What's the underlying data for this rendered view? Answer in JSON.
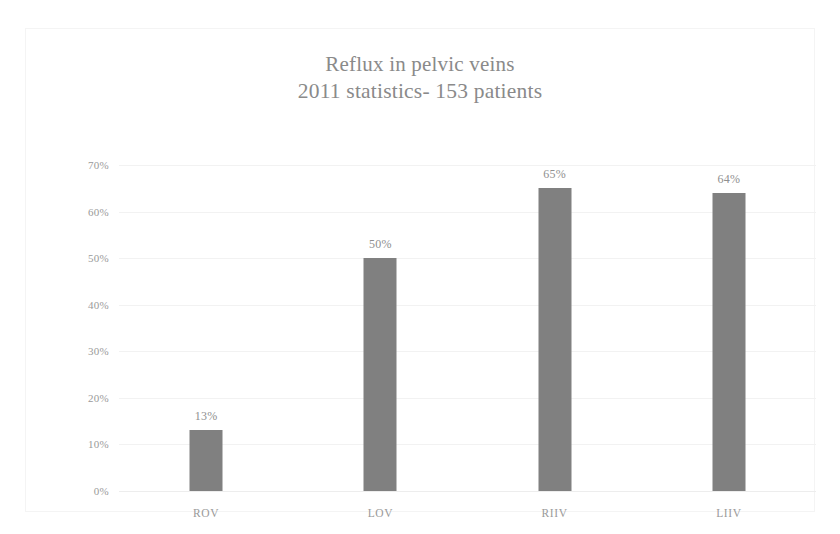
{
  "chart_data": {
    "type": "bar",
    "title": "Reflux in pelvic veins\n2011 statistics- 153 patients",
    "title_line_1": "Reflux in pelvic veins",
    "title_line_2": "2011 statistics- 153 patients",
    "categories": [
      "ROV",
      "LOV",
      "RIIV",
      "LIIV"
    ],
    "values": [
      13,
      50,
      65,
      64
    ],
    "data_labels": [
      "13%",
      "50%",
      "65%",
      "64%"
    ],
    "xlabel": "",
    "ylabel": "",
    "ylim": [
      0,
      70
    ],
    "ytick_values": [
      0,
      10,
      20,
      30,
      40,
      50,
      60,
      70
    ],
    "ytick_labels": [
      "0%",
      "10%",
      "20%",
      "30%",
      "40%",
      "50%",
      "60%",
      "70%"
    ],
    "grid": true,
    "grid_axis": "y",
    "legend": false,
    "legend_position": "none",
    "bar_color": "#808080",
    "gridline_color": "#f2f2f2",
    "text_color": "#8f8f8f",
    "background_color": "#ffffff"
  }
}
